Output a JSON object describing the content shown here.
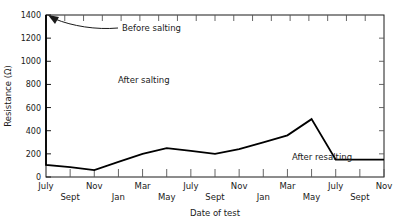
{
  "chart_data": {
    "type": "line",
    "title": "",
    "xlabel": "Date of test",
    "ylabel": "Resistance (Ω)",
    "ylim": [
      0,
      1400
    ],
    "ytick_values": [
      0,
      200,
      400,
      600,
      800,
      1000,
      1200,
      1400
    ],
    "ytick_labels": [
      "0",
      "200",
      "400",
      "600",
      "800",
      "1000",
      "1200",
      "1400"
    ],
    "xtick_labels": [
      "July",
      "Sept",
      "Nov",
      "Jan",
      "Mar",
      "May",
      "July",
      "Sept",
      "Nov",
      "Jan",
      "Mar",
      "May",
      "July",
      "Sept",
      "Nov"
    ],
    "xtick_rows": [
      "top",
      "bottom",
      "top",
      "bottom",
      "top",
      "bottom",
      "top",
      "bottom",
      "top",
      "bottom",
      "top",
      "bottom",
      "top",
      "bottom",
      "top"
    ],
    "grid": false,
    "legend": "none",
    "minor_ticks_top": 18,
    "series": [
      {
        "name": "Resistance",
        "color": "#000000",
        "x": [
          0,
          0,
          1,
          2,
          3,
          4,
          5,
          6,
          7,
          8,
          9,
          10,
          11,
          12,
          13,
          14
        ],
        "x_labels": [
          "July",
          "July",
          "Sept",
          "Nov",
          "Jan",
          "Mar",
          "May",
          "July",
          "Sept",
          "Nov",
          "Jan",
          "Mar",
          "May",
          "July",
          "Sept",
          "Nov"
        ],
        "values": [
          1400,
          105,
          85,
          60,
          130,
          200,
          250,
          225,
          200,
          240,
          300,
          360,
          500,
          150,
          150,
          150
        ]
      }
    ],
    "annotations": [
      {
        "name": "before-salting",
        "text": "Before salting",
        "x_px": 122,
        "y_px": 31,
        "arrow": true
      },
      {
        "name": "after-salting",
        "text": "After salting",
        "x_px": 118,
        "y_px": 83,
        "arrow": false
      },
      {
        "name": "after-resalting",
        "text": "After resalting",
        "x_px": 322,
        "y_px": 160,
        "arrow": false
      }
    ]
  }
}
